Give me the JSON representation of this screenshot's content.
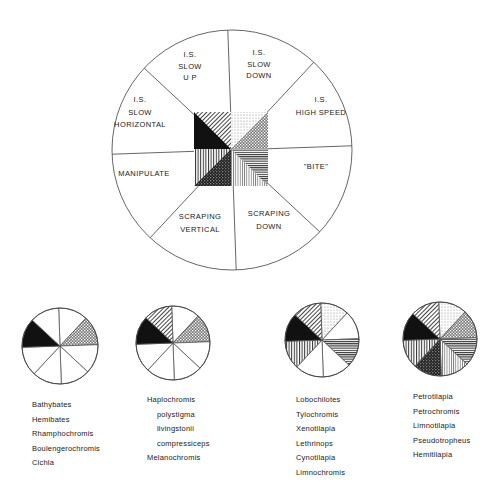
{
  "diagram": {
    "type": "sector-wheel",
    "key_wheel": {
      "sectors": [
        {
          "id": "slow_down",
          "label_lines": [
            "I.S.",
            "SLOW",
            "DOWN"
          ],
          "pattern": "light-dots"
        },
        {
          "id": "high_speed",
          "label_lines": [
            "I.S.",
            "HIGH SPEED"
          ],
          "pattern": "crosshatch"
        },
        {
          "id": "bite",
          "label_lines": [
            "\"BITE\""
          ],
          "pattern": "horizontal-lines"
        },
        {
          "id": "scraping_down",
          "label_lines": [
            "SCRAPING",
            "DOWN"
          ],
          "pattern": "fine-vertical"
        },
        {
          "id": "scraping_vertical",
          "label_lines": [
            "SCRAPING",
            "VERTICAL"
          ],
          "pattern": "dark-stipple"
        },
        {
          "id": "manipulate",
          "label_lines": [
            "MANIPULATE"
          ],
          "pattern": "vertical-lines"
        },
        {
          "id": "slow_horizontal",
          "label_lines": [
            "I.S.",
            "SLOW",
            "HORIZONTAL"
          ],
          "pattern": "solid-black"
        },
        {
          "id": "slow_up",
          "label_lines": [
            "I.S.",
            "SLOW",
            "U P"
          ],
          "pattern": "diagonal-lines"
        }
      ]
    },
    "groups": [
      {
        "active": [
          "slow_horizontal",
          "high_speed"
        ],
        "taxa": [
          {
            "name": "Bathybates",
            "indent": false
          },
          {
            "name": "Hemibates",
            "indent": false
          },
          {
            "name": "Rhamphochromis",
            "indent": false
          },
          {
            "name": "Boulengerochromis",
            "indent": false
          },
          {
            "name": "Cichla",
            "indent": false
          }
        ]
      },
      {
        "active": [
          "slow_horizontal",
          "high_speed",
          "slow_up"
        ],
        "taxa": [
          {
            "name": "Haplochromis",
            "indent": false
          },
          {
            "name": "polystigma",
            "indent": true
          },
          {
            "name": "livingstonii",
            "indent": true
          },
          {
            "name": "compressiceps",
            "indent": true
          },
          {
            "name": "Melanochromis",
            "indent": false
          }
        ]
      },
      {
        "active": [
          "slow_horizontal",
          "slow_up",
          "slow_down",
          "bite",
          "manipulate"
        ],
        "taxa": [
          {
            "name": "Lobochilotes",
            "indent": false
          },
          {
            "name": "Tylochromis",
            "indent": false
          },
          {
            "name": "Xenotilapia",
            "indent": false
          },
          {
            "name": "Lethrinops",
            "indent": false
          },
          {
            "name": "Cynotilapia",
            "indent": false
          },
          {
            "name": "Limnochromis",
            "indent": false
          }
        ]
      },
      {
        "active": [
          "slow_horizontal",
          "slow_up",
          "slow_down",
          "high_speed",
          "bite",
          "scraping_down",
          "scraping_vertical",
          "manipulate"
        ],
        "taxa": [
          {
            "name": "Petrotilapia",
            "indent": false
          },
          {
            "name": "Petrochromis",
            "indent": false
          },
          {
            "name": "Limnotilapia",
            "indent": false
          },
          {
            "name": "Pseudotropheus",
            "indent": false
          },
          {
            "name": "Hemitilapia",
            "indent": false
          }
        ]
      }
    ]
  }
}
